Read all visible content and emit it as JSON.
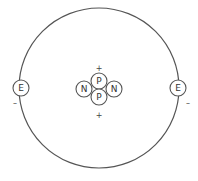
{
  "diagram": {
    "nucleus": {
      "particles": [
        {
          "id": "proton-top",
          "label": "P",
          "type": "proton"
        },
        {
          "id": "proton-bottom",
          "label": "P",
          "type": "proton"
        },
        {
          "id": "neutron-left",
          "label": "N",
          "type": "neutron"
        },
        {
          "id": "neutron-right",
          "label": "N",
          "type": "neutron"
        }
      ],
      "charges": [
        {
          "id": "charge-top",
          "label": "+"
        },
        {
          "id": "charge-bottom",
          "label": "+"
        }
      ]
    },
    "electrons": [
      {
        "id": "electron-left",
        "label": "E",
        "charge": "–"
      },
      {
        "id": "electron-right",
        "label": "E",
        "charge": "–"
      }
    ],
    "colors": {
      "stroke": "#555555",
      "text": "#333333",
      "background": "#ffffff"
    }
  }
}
